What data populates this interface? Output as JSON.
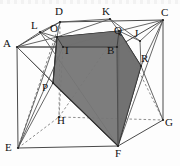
{
  "figure": {
    "kind": "geometry-diagram",
    "canvas": {
      "width": 180,
      "height": 166
    },
    "colors": {
      "stroke": "#3a3a3a",
      "dashed": "#8a8a8a",
      "shade_fill": "#767676",
      "shade_fill_dark": "#6b6b6b",
      "shade_stroke": "#2b2b2b",
      "label": "#111111",
      "background": "#fdfdfd"
    },
    "labels": [
      {
        "name": "A",
        "text": "A",
        "x": 3,
        "y": 38
      },
      {
        "name": "B",
        "text": "B",
        "x": 107,
        "y": 45
      },
      {
        "name": "C",
        "text": "C",
        "x": 161,
        "y": 7
      },
      {
        "name": "D",
        "text": "D",
        "x": 55,
        "y": 6
      },
      {
        "name": "E",
        "text": "E",
        "x": 5,
        "y": 142
      },
      {
        "name": "F",
        "text": "F",
        "x": 115,
        "y": 148
      },
      {
        "name": "G",
        "text": "G",
        "x": 165,
        "y": 117
      },
      {
        "name": "H",
        "text": "H",
        "x": 57,
        "y": 115
      },
      {
        "name": "I",
        "text": "I",
        "x": 65,
        "y": 45
      },
      {
        "name": "J",
        "text": "J",
        "x": 134,
        "y": 28
      },
      {
        "name": "K",
        "text": "K",
        "x": 102,
        "y": 6
      },
      {
        "name": "L",
        "text": "L",
        "x": 31,
        "y": 20
      },
      {
        "name": "O",
        "text": "O",
        "x": 50,
        "y": 23
      },
      {
        "name": "P",
        "text": "P",
        "x": 42,
        "y": 82
      },
      {
        "name": "Q",
        "text": "Q",
        "x": 114,
        "y": 25
      },
      {
        "name": "R",
        "text": "R",
        "x": 141,
        "y": 53
      }
    ],
    "vertices": {
      "A": [
        17,
        47
      ],
      "B": [
        117,
        47
      ],
      "C": [
        163,
        20
      ],
      "D": [
        60,
        22
      ],
      "E": [
        18,
        148
      ],
      "F": [
        118,
        146
      ],
      "G": [
        163,
        120
      ],
      "H": [
        59,
        117
      ],
      "I": [
        63,
        47
      ],
      "J": [
        140,
        41
      ],
      "K": [
        110,
        19
      ],
      "L": [
        40,
        32
      ],
      "O": [
        57,
        37
      ],
      "P": [
        53,
        83
      ],
      "Q": [
        119,
        31
      ],
      "R": [
        141,
        66
      ]
    },
    "shaded_polygon": [
      "O",
      "Q",
      "R",
      "F",
      "P"
    ]
  }
}
